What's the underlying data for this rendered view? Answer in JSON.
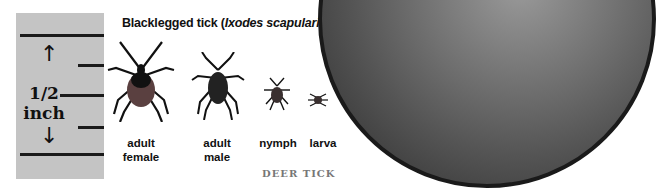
{
  "title": {
    "main": "Blacklegged tick (",
    "scientific": "Ixodes scapularis",
    "close": ")"
  },
  "ruler": {
    "label_line1": "1/2",
    "label_line2": "inch",
    "up_arrow": "↑",
    "down_arrow": "↓"
  },
  "stages": [
    {
      "line1": "adult",
      "line2": "female"
    },
    {
      "line1": "adult",
      "line2": "male"
    },
    {
      "line1": "nymph",
      "line2": ""
    },
    {
      "line1": "larva",
      "line2": ""
    }
  ],
  "caption": "DEER TICK",
  "coin": {
    "name": "dime",
    "visible_text": "ONE DIME"
  }
}
